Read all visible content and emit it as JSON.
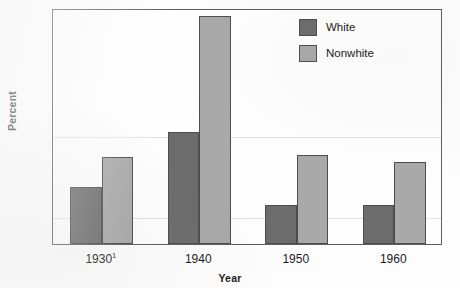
{
  "chart_data": {
    "type": "bar",
    "title": "",
    "subtitle": "",
    "xlabel": "Year",
    "ylabel": "Percent",
    "categories": [
      "1930",
      "1940",
      "1950",
      "1960"
    ],
    "category_footnotes": [
      "1",
      "",
      "",
      ""
    ],
    "series": [
      {
        "name": "White",
        "values": [
          7.2,
          14.2,
          4.9,
          5.0
        ],
        "color": "#6c6c6c"
      },
      {
        "name": "Nonwhite",
        "values": [
          11.1,
          29.0,
          11.3,
          10.4
        ],
        "color": "#a9a9a9"
      }
    ],
    "ylim": [
      0,
      30
    ],
    "yticks": [
      0,
      5,
      10,
      15,
      20,
      25,
      30
    ],
    "ytick_labels": [
      "0",
      "5",
      "10",
      "15",
      "20",
      "25",
      "30"
    ],
    "grid": false,
    "legend_position": "top-right-inside",
    "bar_group_order": [
      "White",
      "Nonwhite"
    ]
  },
  "legend": {
    "entries": [
      {
        "label": "White",
        "swatch": "dark-gray-swatch"
      },
      {
        "label": "Nonwhite",
        "swatch": "light-gray-swatch"
      }
    ]
  },
  "axes": {
    "y_title": "Percent",
    "x_title": "Year"
  }
}
